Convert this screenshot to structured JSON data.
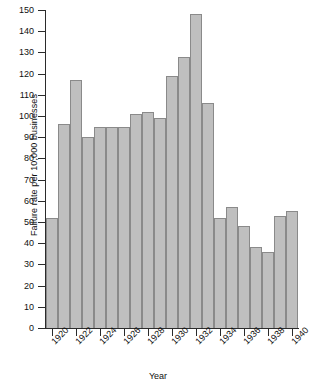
{
  "chart_data": {
    "type": "bar",
    "title": "",
    "xlabel": "Year",
    "ylabel": "Failure rate per 10,000 businesses",
    "ylim": [
      0,
      150
    ],
    "ytick_step": 10,
    "yticks": [
      0,
      10,
      20,
      30,
      40,
      50,
      60,
      70,
      80,
      90,
      100,
      110,
      120,
      130,
      140,
      150
    ],
    "xticks": [
      1920,
      1922,
      1924,
      1926,
      1928,
      1930,
      1932,
      1934,
      1936,
      1938,
      1940
    ],
    "xtick_labels": [
      "1920",
      "1922",
      "1924",
      "1926",
      "1928",
      "1930",
      "1932",
      "1934",
      "1936",
      "1938",
      "1940"
    ],
    "grid": false,
    "legend": false,
    "bar_color": "#bfbfbf",
    "bar_edge_color": "#8a8a8a",
    "axis_color": "#2b2b2b",
    "categories": [
      "1920",
      "1921",
      "1922",
      "1923",
      "1924",
      "1925",
      "1926",
      "1927",
      "1928",
      "1929",
      "1930",
      "1931",
      "1932",
      "1933",
      "1934",
      "1935",
      "1936",
      "1937",
      "1938",
      "1939",
      "1940"
    ],
    "values": [
      52,
      96,
      117,
      90,
      95,
      95,
      95,
      101,
      102,
      99,
      119,
      128,
      148,
      106,
      52,
      57,
      48,
      38,
      36,
      53,
      55
    ]
  }
}
